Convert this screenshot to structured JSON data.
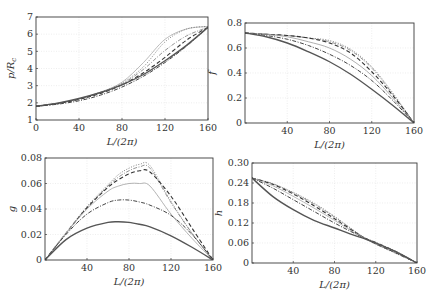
{
  "figure": {
    "width": 431,
    "height": 298
  },
  "chart_data": [
    {
      "id": "p",
      "type": "line",
      "ylabel": "p/R_c",
      "xlabel": "L/(2π)",
      "xlim": [
        0,
        160
      ],
      "ylim": [
        1,
        7
      ],
      "xticks": [
        0,
        40,
        80,
        120,
        160
      ],
      "xtick_labels": [
        "0",
        "40",
        "80",
        "120",
        "160"
      ],
      "yticks": [
        1,
        2,
        3,
        4,
        5,
        6,
        7
      ],
      "ytick_labels": [
        "1",
        "2",
        "3",
        "4",
        "5",
        "6",
        "7"
      ],
      "grid": true,
      "box": {
        "left": 36,
        "top": 17,
        "right": 208,
        "bottom": 120
      },
      "x": [
        0,
        20,
        40,
        60,
        80,
        100,
        120,
        140,
        160
      ],
      "series": [
        {
          "name": "solid",
          "style": "solid",
          "color": "#555555",
          "width": 1.4,
          "values": [
            1.8,
            1.98,
            2.25,
            2.6,
            3.05,
            3.65,
            4.45,
            5.35,
            6.4
          ]
        },
        {
          "name": "dashdot-dark",
          "style": "dashdot",
          "color": "#444444",
          "width": 1.0,
          "values": [
            1.8,
            1.92,
            2.12,
            2.45,
            2.92,
            3.55,
            4.35,
            5.3,
            6.4
          ]
        },
        {
          "name": "dashed",
          "style": "dashed",
          "color": "#333333",
          "width": 1.1,
          "values": [
            1.8,
            1.95,
            2.2,
            2.55,
            3.05,
            3.75,
            4.65,
            5.65,
            6.4
          ]
        },
        {
          "name": "dashdot-light",
          "style": "dashdot",
          "color": "#888888",
          "width": 0.9,
          "values": [
            1.8,
            1.97,
            2.22,
            2.6,
            3.1,
            3.95,
            5.05,
            5.9,
            6.4
          ]
        },
        {
          "name": "dotted",
          "style": "dotted",
          "color": "#777777",
          "width": 0.9,
          "values": [
            1.8,
            1.97,
            2.23,
            2.62,
            3.15,
            4.1,
            5.55,
            6.3,
            6.45
          ]
        },
        {
          "name": "solid-light",
          "style": "solid",
          "color": "#aaaaaa",
          "width": 0.8,
          "values": [
            1.8,
            1.97,
            2.23,
            2.62,
            3.2,
            4.35,
            5.7,
            6.3,
            6.45
          ]
        }
      ]
    },
    {
      "id": "f",
      "type": "line",
      "ylabel": "f",
      "xlabel": "L/(2π)",
      "xlim": [
        0,
        160
      ],
      "ylim": [
        0,
        0.8
      ],
      "xticks": [
        40,
        80,
        120,
        160
      ],
      "xtick_labels": [
        "40",
        "80",
        "120",
        "160"
      ],
      "yticks": [
        0,
        0.2,
        0.4,
        0.6,
        0.8
      ],
      "ytick_labels": [
        "0",
        "0.2",
        "0.4",
        "0.6",
        "0.8"
      ],
      "grid": true,
      "box": {
        "left": 245,
        "top": 23,
        "right": 414,
        "bottom": 123
      },
      "x": [
        0,
        20,
        40,
        60,
        80,
        100,
        120,
        140,
        160
      ],
      "series": [
        {
          "name": "solid",
          "style": "solid",
          "color": "#555555",
          "width": 1.4,
          "values": [
            0.72,
            0.69,
            0.64,
            0.57,
            0.49,
            0.39,
            0.27,
            0.14,
            0.0
          ]
        },
        {
          "name": "dashdot-dark",
          "style": "dashdot",
          "color": "#444444",
          "width": 1.0,
          "values": [
            0.72,
            0.7,
            0.67,
            0.62,
            0.55,
            0.46,
            0.34,
            0.18,
            0.0
          ]
        },
        {
          "name": "solid-light",
          "style": "solid",
          "color": "#999999",
          "width": 0.8,
          "values": [
            0.72,
            0.71,
            0.69,
            0.65,
            0.6,
            0.51,
            0.38,
            0.2,
            0.0
          ]
        },
        {
          "name": "dashed",
          "style": "dashed",
          "color": "#333333",
          "width": 1.1,
          "values": [
            0.72,
            0.71,
            0.7,
            0.68,
            0.64,
            0.56,
            0.41,
            0.22,
            0.0
          ]
        },
        {
          "name": "dashdot-light",
          "style": "dashdot",
          "color": "#888888",
          "width": 0.9,
          "values": [
            0.72,
            0.71,
            0.7,
            0.68,
            0.65,
            0.58,
            0.44,
            0.23,
            0.0
          ]
        },
        {
          "name": "dotted",
          "style": "dotted",
          "color": "#777777",
          "width": 0.9,
          "values": [
            0.72,
            0.71,
            0.7,
            0.68,
            0.66,
            0.59,
            0.45,
            0.24,
            0.0
          ]
        }
      ]
    },
    {
      "id": "g",
      "type": "line",
      "ylabel": "g",
      "xlabel": "L/(2π)",
      "xlim": [
        0,
        160
      ],
      "ylim": [
        0,
        0.08
      ],
      "xticks": [
        40,
        80,
        120,
        160
      ],
      "xtick_labels": [
        "40",
        "80",
        "120",
        "160"
      ],
      "yticks": [
        0,
        0.02,
        0.04,
        0.06,
        0.08
      ],
      "ytick_labels": [
        "0",
        "0.02",
        "0.04",
        "0.06",
        "0.08"
      ],
      "grid": true,
      "box": {
        "left": 45,
        "top": 158,
        "right": 213,
        "bottom": 260
      },
      "x": [
        0,
        20,
        40,
        60,
        70,
        80,
        90,
        100,
        120,
        140,
        160
      ],
      "series": [
        {
          "name": "solid",
          "style": "solid",
          "color": "#555555",
          "width": 1.4,
          "values": [
            0.0,
            0.016,
            0.025,
            0.0295,
            0.03,
            0.0295,
            0.028,
            0.026,
            0.019,
            0.01,
            0.0
          ]
        },
        {
          "name": "dashdot-dark",
          "style": "dashdot",
          "color": "#444444",
          "width": 1.0,
          "values": [
            0.0,
            0.02,
            0.036,
            0.045,
            0.047,
            0.047,
            0.0455,
            0.043,
            0.035,
            0.02,
            0.0
          ]
        },
        {
          "name": "solid-light",
          "style": "solid",
          "color": "#aaaaaa",
          "width": 0.9,
          "values": [
            0.0,
            0.021,
            0.04,
            0.054,
            0.058,
            0.06,
            0.06,
            0.058,
            0.036,
            0.017,
            0.0
          ]
        },
        {
          "name": "dashed",
          "style": "dashed",
          "color": "#333333",
          "width": 1.1,
          "values": [
            0.0,
            0.021,
            0.041,
            0.057,
            0.063,
            0.0675,
            0.07,
            0.069,
            0.05,
            0.025,
            0.0
          ]
        },
        {
          "name": "dashdot-light",
          "style": "dashdot",
          "color": "#888888",
          "width": 0.9,
          "values": [
            0.0,
            0.021,
            0.041,
            0.058,
            0.065,
            0.07,
            0.073,
            0.072,
            0.045,
            0.021,
            0.0
          ]
        },
        {
          "name": "dotted",
          "style": "dotted",
          "color": "#777777",
          "width": 0.9,
          "values": [
            0.0,
            0.021,
            0.042,
            0.059,
            0.067,
            0.072,
            0.075,
            0.074,
            0.046,
            0.021,
            0.0
          ]
        }
      ]
    },
    {
      "id": "h",
      "type": "line",
      "ylabel": "h",
      "xlabel": "L/(2π)",
      "xlim": [
        0,
        160
      ],
      "ylim": [
        0,
        0.3
      ],
      "xticks": [
        40,
        80,
        120,
        160
      ],
      "xtick_labels": [
        "40",
        "80",
        "120",
        "160"
      ],
      "yticks": [
        0,
        0.06,
        0.12,
        0.18,
        0.24,
        0.3
      ],
      "ytick_labels": [
        "0",
        "0.06",
        "0.12",
        "0.18",
        "0.24",
        "0.30"
      ],
      "grid": true,
      "box": {
        "left": 252,
        "top": 163,
        "right": 417,
        "bottom": 263
      },
      "x": [
        0,
        20,
        40,
        60,
        80,
        100,
        110,
        120,
        140,
        160
      ],
      "series": [
        {
          "name": "solid",
          "style": "solid",
          "color": "#555555",
          "width": 1.4,
          "values": [
            0.255,
            0.2,
            0.16,
            0.128,
            0.105,
            0.082,
            0.072,
            0.06,
            0.033,
            0.0
          ]
        },
        {
          "name": "dashdot-dark",
          "style": "dashdot",
          "color": "#444444",
          "width": 1.0,
          "values": [
            0.255,
            0.225,
            0.19,
            0.155,
            0.12,
            0.088,
            0.074,
            0.062,
            0.034,
            0.0
          ]
        },
        {
          "name": "solid-light",
          "style": "solid",
          "color": "#aaaaaa",
          "width": 0.8,
          "values": [
            0.255,
            0.232,
            0.2,
            0.165,
            0.128,
            0.09,
            0.074,
            0.06,
            0.032,
            0.0
          ]
        },
        {
          "name": "dashed",
          "style": "dashed",
          "color": "#333333",
          "width": 1.1,
          "values": [
            0.255,
            0.236,
            0.207,
            0.172,
            0.133,
            0.092,
            0.074,
            0.058,
            0.03,
            0.0
          ]
        },
        {
          "name": "dashdot-light",
          "style": "dashdot",
          "color": "#888888",
          "width": 0.9,
          "values": [
            0.255,
            0.238,
            0.21,
            0.177,
            0.138,
            0.094,
            0.074,
            0.057,
            0.029,
            0.0
          ]
        },
        {
          "name": "dotted",
          "style": "dotted",
          "color": "#777777",
          "width": 0.9,
          "values": [
            0.255,
            0.238,
            0.212,
            0.18,
            0.14,
            0.095,
            0.074,
            0.056,
            0.028,
            0.0
          ]
        }
      ]
    }
  ]
}
